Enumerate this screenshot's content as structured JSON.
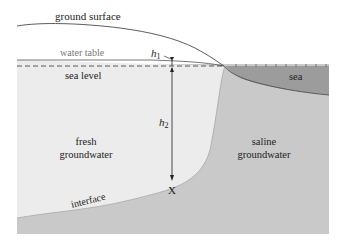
{
  "diagram": {
    "labels": {
      "ground_surface": "ground surface",
      "water_table": "water table",
      "sea_level": "sea level",
      "sea": "sea",
      "h1": "h",
      "h1_sub": "1",
      "h2": "h",
      "h2_sub": "2",
      "fresh_line1": "fresh",
      "fresh_line2": "groundwater",
      "saline_line1": "saline",
      "saline_line2": "groundwater",
      "point": "X",
      "interface": "interface"
    },
    "colors": {
      "fresh": "#ececec",
      "saline": "#c8c8c8",
      "sea": "#9a9a9a",
      "line": "#333333",
      "water_table_text": "#777777"
    }
  }
}
